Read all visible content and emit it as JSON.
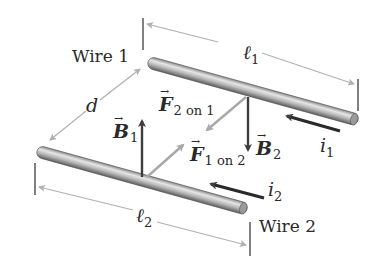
{
  "diagram": {
    "colors": {
      "wire_light": "#e4e4e4",
      "wire_dark": "#6e6e6e",
      "dark_arrow": "#3d3d3d",
      "light_arrow": "#a8a8a8",
      "dim_line": "#b0b0b0",
      "text": "#2a2a2a"
    },
    "wires": [
      {
        "label": "Wire 1",
        "length_symbol": "ℓ",
        "length_sub": "1",
        "current_symbol": "i",
        "current_sub": "1"
      },
      {
        "label": "Wire 2",
        "length_symbol": "ℓ",
        "length_sub": "2",
        "current_symbol": "i",
        "current_sub": "2"
      }
    ],
    "separation": {
      "symbol": "d"
    },
    "vectors": {
      "B1": {
        "symbol": "B",
        "sub": "1",
        "direction": "up"
      },
      "B2": {
        "symbol": "B",
        "sub": "2",
        "direction": "down"
      },
      "F2on1": {
        "symbol": "F",
        "sub": "2 on 1",
        "direction": "toward wire 2"
      },
      "F1on2": {
        "symbol": "F",
        "sub": "1 on 2",
        "direction": "toward wire 1"
      }
    }
  }
}
